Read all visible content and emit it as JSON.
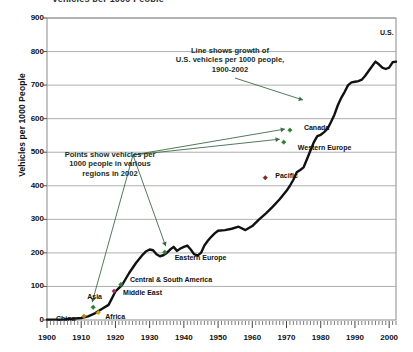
{
  "page": {
    "clipped_header": "Vehicles per 1000 People"
  },
  "chart_data": {
    "type": "line",
    "title": "",
    "xlabel": "",
    "ylabel": "Vehicles per 1000 People",
    "xlim": [
      1900,
      2002
    ],
    "ylim": [
      0,
      900
    ],
    "grid": true,
    "legend_position": "none",
    "x_ticks": [
      "1900",
      "1910",
      "1920",
      "1930",
      "1940",
      "1950",
      "1960",
      "1970",
      "1980",
      "1990",
      "2000"
    ],
    "y_ticks": [
      "0",
      "100",
      "200",
      "300",
      "400",
      "500",
      "600",
      "700",
      "800",
      "900"
    ],
    "x_minor_tick_interval": 1,
    "series": [
      {
        "name": "U.S. vehicles per 1000 people",
        "color": "#111111",
        "x": [
          1900,
          1905,
          1910,
          1912,
          1914,
          1916,
          1918,
          1920,
          1922,
          1924,
          1926,
          1928,
          1929,
          1930,
          1931,
          1932,
          1933,
          1934,
          1935,
          1936,
          1937,
          1938,
          1939,
          1940,
          1941,
          1942,
          1943,
          1944,
          1945,
          1946,
          1947,
          1948,
          1949,
          1950,
          1952,
          1954,
          1956,
          1958,
          1960,
          1962,
          1964,
          1966,
          1968,
          1970,
          1971,
          1972,
          1973,
          1974,
          1975,
          1976,
          1977,
          1978,
          1979,
          1980,
          1981,
          1982,
          1983,
          1984,
          1985,
          1986,
          1987,
          1988,
          1989,
          1990,
          1991,
          1992,
          1993,
          1994,
          1995,
          1996,
          1997,
          1998,
          1999,
          2000,
          2001,
          2002
        ],
        "y": [
          1,
          2,
          6,
          11,
          20,
          33,
          45,
          85,
          105,
          140,
          170,
          195,
          205,
          210,
          208,
          196,
          190,
          193,
          200,
          210,
          218,
          206,
          213,
          218,
          222,
          210,
          196,
          192,
          200,
          222,
          236,
          248,
          258,
          266,
          268,
          272,
          278,
          268,
          280,
          300,
          318,
          338,
          360,
          385,
          400,
          418,
          440,
          447,
          455,
          480,
          505,
          530,
          548,
          552,
          560,
          570,
          590,
          612,
          640,
          662,
          680,
          700,
          708,
          710,
          712,
          716,
          728,
          742,
          756,
          770,
          762,
          752,
          748,
          752,
          768,
          770
        ]
      }
    ],
    "points_2002": [
      {
        "name": "China",
        "x": 1910.8,
        "y": 11,
        "color": "#b8860b",
        "label_dx": -28,
        "label_dy": 3,
        "marker": "diamond"
      },
      {
        "name": "Africa",
        "x": 1915.0,
        "y": 22,
        "color": "#c8a400",
        "label_dx": 7,
        "label_dy": 4,
        "marker": "diamond"
      },
      {
        "name": "Asia",
        "x": 1913.5,
        "y": 38,
        "color": "#2f7d32",
        "label_dx": -6,
        "label_dy": -10,
        "marker": "diamond"
      },
      {
        "name": "Middle East",
        "x": 1919.6,
        "y": 86,
        "color": "#a0305a",
        "label_dx": 9,
        "label_dy": 2,
        "marker": "diamond"
      },
      {
        "name": "Central & South America",
        "x": 1921.6,
        "y": 106,
        "color": "#2f7d32",
        "label_dx": 9,
        "label_dy": -4,
        "marker": "diamond"
      },
      {
        "name": "Eastern Europe",
        "x": 1934.4,
        "y": 202,
        "color": "#2f7d32",
        "label_dx": 10,
        "label_dy": 6,
        "marker": "diamond"
      },
      {
        "name": "Pacific",
        "x": 1963.8,
        "y": 424,
        "color": "#7a2b2b",
        "label_dx": 10,
        "label_dy": -2,
        "marker": "diamond"
      },
      {
        "name": "Western Europe",
        "x": 1969.2,
        "y": 530,
        "color": "#2f7d32",
        "label_dx": 14,
        "label_dy": 6,
        "marker": "diamond"
      },
      {
        "name": "Canada",
        "x": 1971.0,
        "y": 566,
        "color": "#2f7d32",
        "label_dx": 14,
        "label_dy": -2,
        "marker": "diamond"
      }
    ],
    "end_label": {
      "name": "U.S.",
      "x": 2002,
      "y": 830
    },
    "annotations": [
      {
        "id": "line-note",
        "text": "Line shows growth of\nU.S. vehicles per 1000 people,\n1900-2002",
        "color": "#17301f"
      },
      {
        "id": "points-note",
        "text": "Points show vehicles per\n1000 people in various\nregions in 2002",
        "color": "#17301f"
      }
    ]
  }
}
